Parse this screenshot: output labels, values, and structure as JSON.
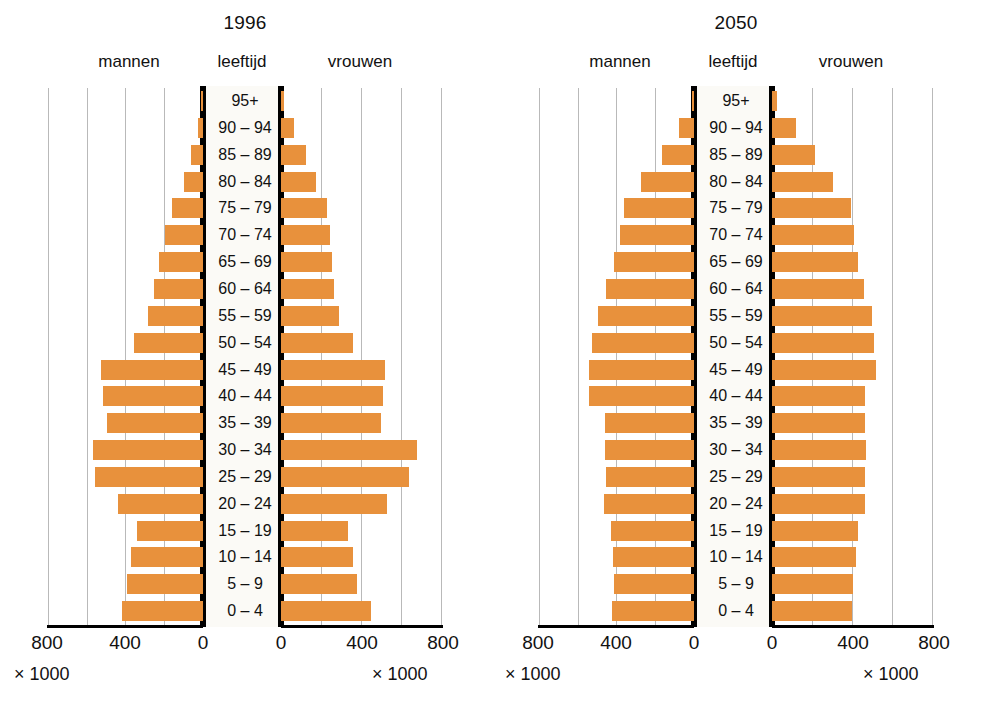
{
  "chart_data": {
    "type": "bar",
    "chart_kind": "population-pyramid",
    "categories": [
      "95+",
      "90 – 94",
      "85 – 89",
      "80 – 84",
      "75 – 79",
      "70 – 74",
      "65 – 69",
      "60 – 64",
      "55 – 59",
      "50 – 54",
      "45 – 49",
      "40 – 44",
      "35 – 39",
      "30 – 34",
      "25 – 29",
      "20 – 24",
      "15 – 19",
      "10 – 14",
      "5 – 9",
      "0 – 4"
    ],
    "xlabel": "× 1000",
    "ylabel": "leeftijd",
    "xlim": [
      0,
      800
    ],
    "xticks": [
      800,
      400,
      0
    ],
    "grid": true,
    "legend": [
      "mannen",
      "vrouwen"
    ],
    "units": "× 1000",
    "bar_color": "#e8913c",
    "panels": [
      {
        "year": "1996",
        "series": [
          {
            "name": "mannen",
            "values": [
              5,
              25,
              60,
              100,
              160,
              200,
              230,
              255,
              285,
              360,
              530,
              520,
              500,
              570,
              560,
              440,
              345,
              375,
              395,
              420
            ]
          },
          {
            "name": "vrouwen",
            "values": [
              15,
              65,
              125,
              175,
              230,
              245,
              255,
              265,
              290,
              360,
              520,
              510,
              500,
              680,
              640,
              530,
              335,
              360,
              380,
              450
            ]
          }
        ]
      },
      {
        "year": "2050",
        "series": [
          {
            "name": "mannen",
            "values": [
              10,
              80,
              165,
              275,
              365,
              385,
              415,
              455,
              500,
              530,
              545,
              545,
              465,
              465,
              455,
              470,
              430,
              420,
              415,
              425
            ]
          },
          {
            "name": "vrouwen",
            "values": [
              25,
              120,
              215,
              305,
              395,
              410,
              430,
              460,
              500,
              510,
              520,
              465,
              465,
              470,
              465,
              465,
              430,
              420,
              405,
              400
            ]
          }
        ]
      }
    ]
  },
  "panels": [
    {
      "year_title": "1996",
      "men_label": "mannen",
      "age_label": "leeftijd",
      "women_label": "vrouwen",
      "men_ticks": [
        "800",
        "400",
        "0"
      ],
      "women_ticks": [
        "0",
        "400",
        "800"
      ],
      "unit_men": "× 1000",
      "unit_women": "× 1000"
    },
    {
      "year_title": "2050",
      "men_label": "mannen",
      "age_label": "leeftijd",
      "women_label": "vrouwen",
      "men_ticks": [
        "800",
        "400",
        "0"
      ],
      "women_ticks": [
        "0",
        "400",
        "800"
      ],
      "unit_men": "× 1000",
      "unit_women": "× 1000"
    }
  ]
}
